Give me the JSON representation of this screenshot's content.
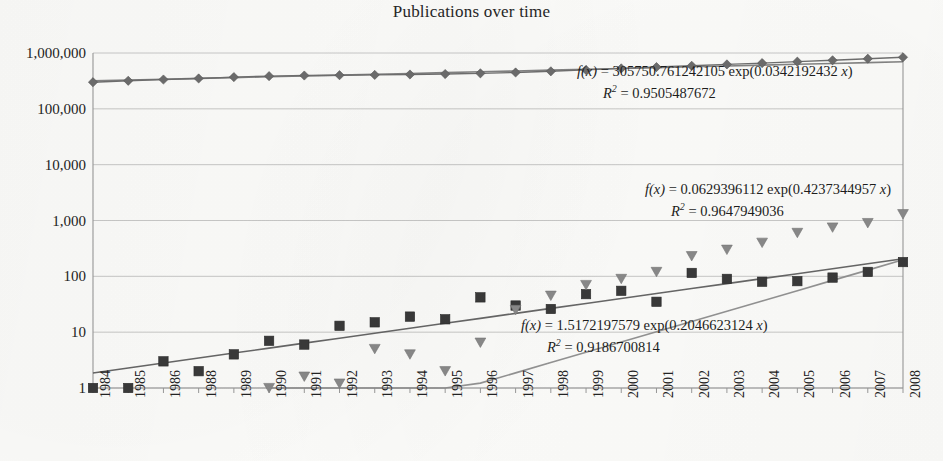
{
  "chart_data": {
    "type": "scatter",
    "title": "Publications over time",
    "xlabel": "",
    "ylabel": "",
    "yscale": "log",
    "ylim": [
      1,
      1000000
    ],
    "grid": true,
    "legend_position": "none",
    "x_tick_labels": [
      "1984",
      "1985",
      "1986",
      "1988",
      "1989",
      "1990",
      "1991",
      "1992",
      "1993",
      "1994",
      "1995",
      "1996",
      "1997",
      "1998",
      "1999",
      "2000",
      "2001",
      "2002",
      "2003",
      "2004",
      "2005",
      "2006",
      "2007",
      "2008"
    ],
    "y_tick_labels": [
      "1,000,000",
      "100,000",
      "10,000",
      "1,000",
      "100",
      "10",
      "1"
    ],
    "y_tick_values": [
      1000000,
      100000,
      10000,
      1000,
      100,
      10,
      1
    ],
    "series": [
      {
        "name": "all-publications",
        "marker": "diamond",
        "color": "#6d6d6d",
        "values": [
          300000,
          318000,
          335000,
          350000,
          370000,
          385000,
          395000,
          400000,
          405000,
          412000,
          420000,
          432000,
          448000,
          470000,
          498000,
          530000,
          560000,
          590000,
          625000,
          660000,
          700000,
          740000,
          790000,
          840000
        ]
      },
      {
        "name": "topic-publications-squares",
        "marker": "square",
        "color": "#3a3a3a",
        "values": [
          1,
          1,
          3,
          2,
          4,
          7,
          6,
          13,
          15,
          19,
          17,
          42,
          30,
          26,
          48,
          55,
          35,
          115,
          90,
          80,
          82,
          95,
          120,
          180
        ]
      },
      {
        "name": "topic-publications-triangles",
        "marker": "triangle-down",
        "color": "#8a8a8a",
        "values": [
          null,
          null,
          null,
          null,
          null,
          1,
          1.6,
          1.2,
          5,
          4,
          2,
          6.5,
          25,
          45,
          70,
          90,
          120,
          230,
          300,
          400,
          600,
          750,
          900,
          1300
        ]
      }
    ],
    "trendlines": [
      {
        "series": "all-publications",
        "color": "#7a7a7a",
        "a": 305750.761242105,
        "b": 0.0342192432,
        "r2": 0.9505487672,
        "equation_text": "f(x) = 305750.761242105 exp(0.0342192432 x)",
        "r2_text": "R2 = 0.9505487672"
      },
      {
        "series": "topic-publications-triangles",
        "color": "#8a8a8a",
        "a": 0.0629396112,
        "b": 0.4237344957,
        "r2": 0.9647949036,
        "equation_text": "f(x) = 0.0629396112 exp(0.4237344957 x)",
        "r2_text": "R2 = 0.9647949036"
      },
      {
        "series": "topic-publications-squares",
        "color": "#5a5a5a",
        "a": 1.5172197579,
        "b": 0.2046623124,
        "r2": 0.9186700814,
        "equation_text": "f(x) = 1.5172197579 exp(0.2046623124 x)",
        "r2_text": "R2 = 0.9186700814"
      }
    ]
  },
  "annotations": {
    "eq1": {
      "fx": "f(x)",
      "body": " = 305750.761242105 exp(0.0342192432 ",
      "tail": ")",
      "r2_label": "R",
      "r2_sup": "2",
      "r2_value": " = 0.9505487672",
      "var": "x"
    },
    "eq2": {
      "fx": "f(x)",
      "body": " = 0.0629396112 exp(0.4237344957 ",
      "tail": ")",
      "r2_label": "R",
      "r2_sup": "2",
      "r2_value": " = 0.9647949036",
      "var": "x"
    },
    "eq3": {
      "fx": "f(x)",
      "body": " = 1.5172197579 exp(0.2046623124 ",
      "tail": ")",
      "r2_label": "R",
      "r2_sup": "2",
      "r2_value": " = 0.9186700814",
      "var": "x"
    }
  },
  "style": {
    "axis_color": "#9a9a9a",
    "grid_color": "#b9b9b9",
    "text_color": "#232323",
    "background": "#fdfdfb"
  }
}
